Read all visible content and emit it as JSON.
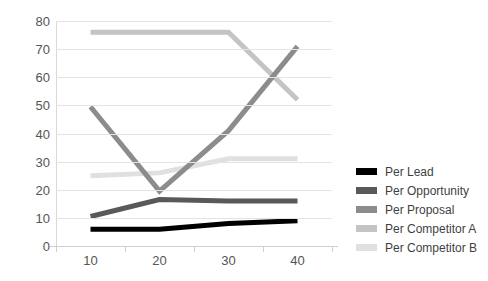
{
  "chart_data": {
    "type": "line",
    "title": "",
    "xlabel": "",
    "ylabel": "",
    "x": [
      10,
      20,
      30,
      40
    ],
    "categories": [
      "10",
      "20",
      "30",
      "40"
    ],
    "xtick_labels": [
      "10",
      "20",
      "30",
      "40"
    ],
    "ytick_labels": [
      "0",
      "10",
      "20",
      "30",
      "40",
      "50",
      "60",
      "70",
      "80"
    ],
    "yticks": [
      0,
      10,
      20,
      30,
      40,
      50,
      60,
      70,
      80
    ],
    "ylim": [
      0,
      80
    ],
    "grid": true,
    "legend_position": "right",
    "series": [
      {
        "name": "Per Lead",
        "values": [
          6,
          6,
          8,
          9
        ],
        "color": "#000000"
      },
      {
        "name": "Per Opportunity",
        "values": [
          10.5,
          16.5,
          16,
          16
        ],
        "color": "#595959"
      },
      {
        "name": "Per Proposal",
        "values": [
          49.5,
          19.5,
          41,
          71
        ],
        "color": "#8c8c8c"
      },
      {
        "name": "Per Competitor A",
        "values": [
          76,
          76,
          76,
          52
        ],
        "color": "#c4c4c4"
      },
      {
        "name": "Per Competitor B",
        "values": [
          25,
          26,
          31,
          31
        ],
        "color": "#e0e0e0"
      }
    ]
  },
  "legend": {
    "items": [
      {
        "label": "Per Lead",
        "color": "#000000"
      },
      {
        "label": "Per Opportunity",
        "color": "#595959"
      },
      {
        "label": "Per Proposal",
        "color": "#8c8c8c"
      },
      {
        "label": "Per Competitor A",
        "color": "#c4c4c4"
      },
      {
        "label": "Per Competitor B",
        "color": "#e0e0e0"
      }
    ]
  },
  "axes": {
    "y_labels": [
      "80",
      "70",
      "60",
      "50",
      "40",
      "30",
      "20",
      "10",
      "0"
    ],
    "x_labels": [
      "10",
      "20",
      "30",
      "40"
    ]
  }
}
